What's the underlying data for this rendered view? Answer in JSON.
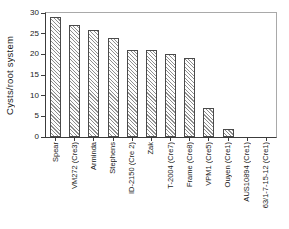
{
  "chart_data": {
    "type": "bar",
    "title": "",
    "xlabel": "",
    "ylabel": "Cysts/root system",
    "ylim": [
      0,
      30
    ],
    "yticks": [
      0,
      5,
      10,
      15,
      20,
      25,
      30
    ],
    "grid": false,
    "legend": false,
    "categories": [
      "Spear",
      "VM272 (Cre3)",
      "Arminda",
      "Stephens",
      "ID-2150 (Cre 2)",
      "Zak",
      "T-2004 (Cre7)",
      "Frame (Cre8)",
      "VPM1 (Cre5)",
      "Ouyen (Cre1)",
      "AUS10894 (Cre1)",
      "63/1-7-15-12 (Cre1)"
    ],
    "values": [
      29,
      27,
      26,
      24,
      21,
      21,
      20,
      19,
      7,
      2,
      0,
      0
    ],
    "bar_style": {
      "fill": "#fdfdfd",
      "hatch": "diagonal",
      "hatch_color": "#8e8e8e",
      "border_color": "#4a4a4a"
    }
  },
  "colors": {
    "background": "#ffffff",
    "axis": "#3c3c3c",
    "frame_light": "#a9a9a9",
    "text": "#1a1a1a"
  }
}
